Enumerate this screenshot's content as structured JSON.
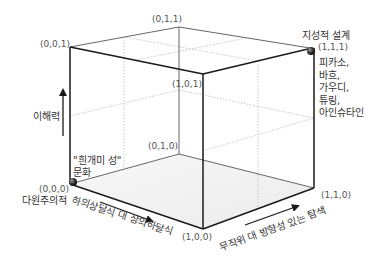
{
  "vertices": {
    "v000": "(0,0,0)",
    "v001": "(0,0,1)",
    "v010": "(0,1,0)",
    "v011": "(0,1,1)",
    "v100": "(1,0,0)",
    "v101": "(1,0,1)",
    "v110": "(1,1,0)",
    "v111": "(1,1,1)"
  },
  "axes": {
    "vertical": "이해력",
    "front_left": "하의상달식 대 상의하달식",
    "front_right": "무작위 대 방향성 있는 탐색"
  },
  "points": {
    "origin": {
      "title_line1": "\"흰개미 성\"",
      "title_line2": "문화",
      "below": "다원주의적"
    },
    "top": {
      "title": "지성적 설계",
      "examples": [
        "피카소,",
        "바흐,",
        "가우디,",
        "튜링,",
        "아인슈타인"
      ]
    }
  },
  "colors": {
    "edge": "#1a1a1a",
    "back_edge": "#555555",
    "dotted": "#bbbbbb",
    "floor": "#f0f0f0",
    "ball": "#2a2a2a"
  }
}
